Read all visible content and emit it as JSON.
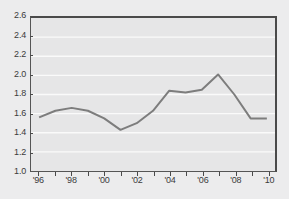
{
  "chart_data": {
    "type": "line",
    "title": "",
    "subtitle": "",
    "xlabel": "",
    "ylabel": "",
    "x": [
      1996,
      1997,
      1998,
      1999,
      2000,
      2001,
      2002,
      2003,
      2004,
      2005,
      2006,
      2007,
      2008,
      2009,
      2010
    ],
    "series": [
      {
        "name": "series-1",
        "color": "#7d7d7d",
        "values": [
          1.56,
          1.63,
          1.66,
          1.63,
          1.55,
          1.43,
          1.5,
          1.63,
          1.84,
          1.82,
          1.85,
          2.01,
          1.8,
          1.55,
          1.55
        ]
      }
    ],
    "xlim": [
      1995.5,
      2010.5
    ],
    "ylim": [
      1.0,
      2.6
    ],
    "yticks": [
      1.0,
      1.2,
      1.4,
      1.6,
      1.8,
      2.0,
      2.2,
      2.4,
      2.6
    ],
    "ytick_labels": [
      "1.0",
      "1.2",
      "1.4",
      "1.6",
      "1.8",
      "2.0",
      "2.2",
      "2.4",
      "2.6"
    ],
    "xticks": [
      1996,
      1997,
      1998,
      1999,
      2000,
      2001,
      2002,
      2003,
      2004,
      2005,
      2006,
      2007,
      2008,
      2009,
      2010
    ],
    "xtick_labels": [
      "'96",
      "",
      "'98",
      "",
      "'00",
      "",
      "'02",
      "",
      "'04",
      "",
      "'06",
      "",
      "'08",
      "",
      "'10"
    ],
    "grid": {
      "horizontal": true,
      "vertical": false,
      "color": "#fafafa"
    },
    "legend": {
      "show": false,
      "position": "none",
      "entries": []
    },
    "annotations": [],
    "colors": {
      "figure_background": "#ececed",
      "plot_background": "#e6e6e7",
      "axis": "#4a4a4a",
      "tick_text": "#3b3b3b",
      "line": "#7d7d7d"
    }
  }
}
